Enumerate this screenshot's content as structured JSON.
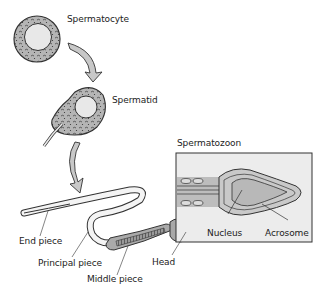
{
  "diagram": {
    "stages": [
      {
        "id": "spermatocyte",
        "label": "Spermatocyte"
      },
      {
        "id": "spermatid",
        "label": "Spermatid"
      },
      {
        "id": "spermatozoon",
        "label": "Spermatozoon"
      }
    ],
    "parts": {
      "end_piece": "End piece",
      "principal_piece": "Principal piece",
      "middle_piece": "Middle piece",
      "head": "Head",
      "nucleus": "Nucleus",
      "acrosome": "Acrosome"
    },
    "colors": {
      "cytoplasm": "#b8b8b8",
      "nucleus": "#e6e6e6",
      "outline": "#333333",
      "tail": "#f2f2f2",
      "head_fill": "#a8a8a8",
      "box_bg": "#ececec"
    }
  }
}
